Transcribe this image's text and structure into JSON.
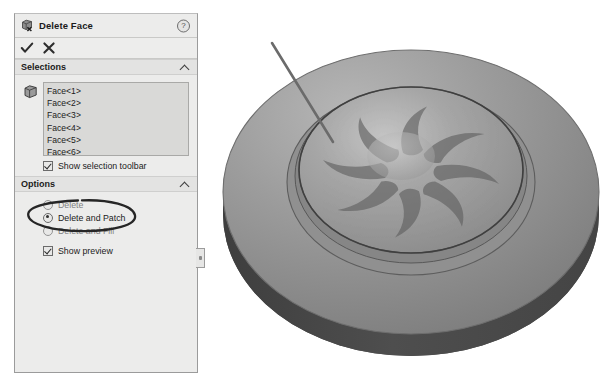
{
  "panel": {
    "title": "Delete Face",
    "title_icon": "delete-face-cube-icon",
    "help_icon": "?",
    "ok_button": {
      "name": "ok-checkmark-button",
      "tooltip": "OK"
    },
    "cancel_button": {
      "name": "cancel-x-button",
      "tooltip": "Cancel"
    },
    "sections": {
      "selections": {
        "label": "Selections",
        "collapse_state": "expanded",
        "face_icon": "face-cube-icon",
        "items": [
          "Face<1>",
          "Face<2>",
          "Face<3>",
          "Face<4>",
          "Face<5>",
          "Face<6>"
        ],
        "checkbox": {
          "label": "Show selection toolbar",
          "checked": true
        }
      },
      "options": {
        "label": "Options",
        "collapse_state": "expanded",
        "radios": [
          {
            "label": "Delete",
            "selected": false,
            "dimmed": true
          },
          {
            "label": "Delete and Patch",
            "selected": true,
            "dimmed": false
          },
          {
            "label": "Delete and Fill",
            "selected": false,
            "dimmed": true
          }
        ],
        "checkbox": {
          "label": "Show preview",
          "checked": true
        }
      }
    }
  },
  "annotation": {
    "type": "hand-drawn-ellipse",
    "target": "Delete and Patch",
    "color": "#262626"
  },
  "viewport": {
    "name": "graphics-area",
    "model": "impeller-disc",
    "leader_line": {
      "from": [
        272,
        43
      ],
      "to": [
        333,
        142
      ],
      "color": "#6b6b6b"
    },
    "blade_count": 8
  },
  "colors": {
    "panel_bg": "#ececeb",
    "panel_border": "#9b9b9b",
    "listbox_bg": "#d9d9d7",
    "section_head_bg": "#e3e3e2",
    "model_top": "#8e8e8e",
    "model_side": "#4a4a4a",
    "model_inner": "#9a9a9a",
    "blade_pocket": "#6f6f6f",
    "text": "#1b1b1b"
  }
}
